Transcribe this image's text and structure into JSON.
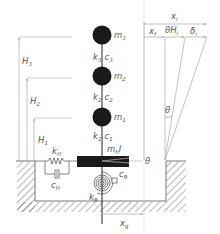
{
  "diagram": {
    "masses": [
      {
        "id": "m3",
        "label": "m",
        "sub": "3",
        "cx": 102,
        "cy": 35
      },
      {
        "id": "m2",
        "label": "m",
        "sub": "2",
        "cx": 102,
        "cy": 76
      },
      {
        "id": "m1",
        "label": "m",
        "sub": "1",
        "cx": 102,
        "cy": 117
      }
    ],
    "links": [
      {
        "k": "k",
        "k_sub": "3",
        "c": "c",
        "c_sub": "3"
      },
      {
        "k": "k",
        "k_sub": "2",
        "c": "c",
        "c_sub": "2"
      },
      {
        "k": "k",
        "k_sub": "1",
        "c": "c",
        "c_sub": "1"
      }
    ],
    "foundation": {
      "label": "m",
      "sub": "h",
      "inertia": "I"
    },
    "horizontal_spring": {
      "k": "k",
      "k_sub": "H",
      "c": "c",
      "c_sub": "H"
    },
    "rocking_spring": {
      "k": "k",
      "k_sub": "R",
      "c": "c",
      "c_sub": "R"
    },
    "heights": [
      {
        "label": "H",
        "sub": "3"
      },
      {
        "label": "H",
        "sub": "2"
      },
      {
        "label": "H",
        "sub": "1"
      }
    ],
    "displacements": {
      "total": {
        "label": "x",
        "sub": "i"
      },
      "foundation": {
        "label": "x",
        "sub": "f"
      },
      "rotation": {
        "label": "θH",
        "sub": "i"
      },
      "deformation": {
        "label": "δ",
        "sub": "i"
      },
      "ground": {
        "label": "x",
        "sub": "g"
      }
    },
    "angle_label": "θ",
    "base_angle_label": "θ",
    "colors": {
      "ink": "#1a1a1a",
      "line": "#555555",
      "light_line": "#999999",
      "hatch": "#777777"
    }
  }
}
